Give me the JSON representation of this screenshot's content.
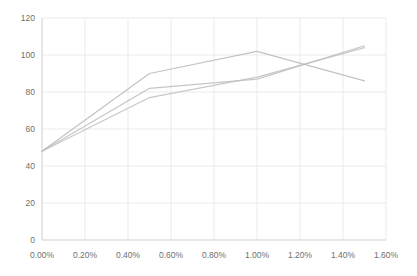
{
  "chart_data": {
    "type": "line",
    "title": "",
    "subtitle": "",
    "xlabel": "",
    "ylabel": "",
    "grid": true,
    "legend": "none",
    "xlim": [
      0.0,
      1.6
    ],
    "ylim": [
      0,
      120
    ],
    "x_tick_labels": [
      "0.00%",
      "0.20%",
      "0.40%",
      "0.60%",
      "0.80%",
      "1.00%",
      "1.20%",
      "1.40%",
      "1.60%"
    ],
    "x_tick_values": [
      0.0,
      0.2,
      0.4,
      0.6,
      0.8,
      1.0,
      1.2,
      1.4,
      1.6
    ],
    "y_tick_labels": [
      "0",
      "20",
      "40",
      "60",
      "80",
      "100",
      "120"
    ],
    "y_tick_values": [
      0,
      20,
      40,
      60,
      80,
      100,
      120
    ],
    "x": [
      0.0,
      0.5,
      1.0,
      1.5
    ],
    "series": [
      {
        "name": "series-1",
        "color": "#b6b6bb",
        "values": [
          48,
          90,
          102,
          86
        ]
      },
      {
        "name": "series-2",
        "color": "#b9b9be",
        "values": [
          48,
          82,
          87,
          105
        ]
      },
      {
        "name": "series-3",
        "color": "#bdbdc2",
        "values": [
          48,
          77,
          88,
          104
        ]
      }
    ]
  },
  "axes": {
    "y_axis_name": "value-axis",
    "x_axis_name": "percentage-axis"
  }
}
